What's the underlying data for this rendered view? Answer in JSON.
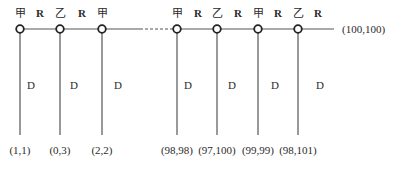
{
  "diagram": {
    "type": "game-tree",
    "line_color": "#555555",
    "main_line": {
      "y": 29,
      "x_start": 20,
      "solid_end_1": 140,
      "dash_start": 140,
      "dash_end": 172,
      "x_end": 334
    },
    "terminal_label": "(100,100)",
    "nodes": [
      {
        "x": 20,
        "player": "甲",
        "payoff": "(1,1)"
      },
      {
        "x": 60,
        "player": "乙",
        "payoff": "(0,3)"
      },
      {
        "x": 102,
        "player": "甲",
        "payoff": "(2,2)"
      },
      {
        "x": 177,
        "player": "甲",
        "payoff": "(98,98)"
      },
      {
        "x": 217,
        "player": "乙",
        "payoff": "(97,100)"
      },
      {
        "x": 258,
        "player": "甲",
        "payoff": "(99,99)"
      },
      {
        "x": 298,
        "player": "乙",
        "payoff": "(98,101)"
      }
    ],
    "r_labels": [
      {
        "x": 40,
        "text": "R"
      },
      {
        "x": 82,
        "text": "R"
      },
      {
        "x": 198,
        "text": "R"
      },
      {
        "x": 238,
        "text": "R"
      },
      {
        "x": 278,
        "text": "R"
      },
      {
        "x": 318,
        "text": "R"
      }
    ],
    "d_labels": [
      {
        "x": 31,
        "text": "D"
      },
      {
        "x": 74,
        "text": "D"
      },
      {
        "x": 118,
        "text": "D"
      },
      {
        "x": 188,
        "text": "D"
      },
      {
        "x": 232,
        "text": "D"
      },
      {
        "x": 275,
        "text": "D"
      },
      {
        "x": 320,
        "text": "D"
      }
    ]
  }
}
